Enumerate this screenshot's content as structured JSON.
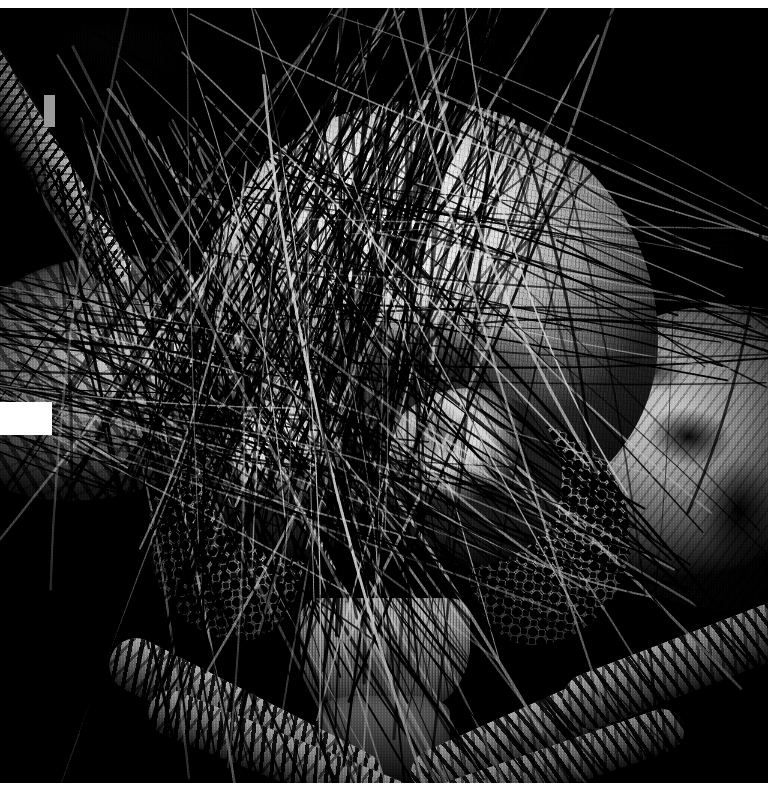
{
  "figure": {
    "kind": "scanning-electron-micrograph",
    "rendering": "monochrome black-and-white",
    "orientation": "portrait",
    "width_px": 778,
    "height_px": 804,
    "plate": {
      "left_px": 0,
      "top_px": 8,
      "width_px": 768,
      "height_px": 775
    },
    "margins": {
      "top_px": 8,
      "right_px": 10,
      "bottom_px": 21,
      "left_px": 0,
      "color": "#ffffff"
    }
  },
  "palette": {
    "background": "#000000",
    "plate_dark": "#05060a",
    "specimen_highlight": "#f2f1ee",
    "specimen_midtone": "#8e8b85",
    "specimen_shadow": "#2b2a29",
    "paper_white": "#ffffff",
    "gray_tab": "#9a9a9a"
  },
  "overlays": [
    {
      "name": "gray-tab-mark",
      "shape": "rectangle",
      "color": "#9a9a9a",
      "x": 44,
      "y": 95,
      "w": 11,
      "h": 32
    },
    {
      "name": "white-block-mask",
      "shape": "rectangle",
      "color": "#ffffff",
      "x": 0,
      "y": 402,
      "w": 52,
      "h": 33
    }
  ],
  "anatomy": {
    "vertex_dome": {
      "label": "head capsule / vertex",
      "x": 188,
      "y": 92,
      "w": 470,
      "h": 430,
      "tone": "bright"
    },
    "eye_left": {
      "label": "compound eye (left)",
      "x": 148,
      "y": 424,
      "w": 160,
      "h": 210,
      "facet_diameter_px": 18,
      "facet_pattern": "hexagonal close-packed ommatidia"
    },
    "eye_right": {
      "label": "compound eye (right)",
      "x": 462,
      "y": 418,
      "w": 168,
      "h": 220,
      "facet_diameter_px": 18,
      "facet_pattern": "hexagonal close-packed ommatidia"
    },
    "pedicel_left": {
      "label": "antennal pedicel / torus (left)",
      "x": 206,
      "y": 388,
      "w": 178,
      "h": 162,
      "tone": "bright dome"
    },
    "pedicel_right": {
      "label": "antennal pedicel / torus (right)",
      "x": 376,
      "y": 380,
      "w": 186,
      "h": 178,
      "tone": "bright dome"
    },
    "clypeus": {
      "label": "clypeus",
      "x": 300,
      "y": 590,
      "w": 170,
      "h": 118
    },
    "labium": {
      "label": "labium / proboscis base",
      "x": 318,
      "y": 688,
      "w": 132,
      "h": 96
    },
    "lobe_left": {
      "label": "lateral head lobe (left)",
      "x": -70,
      "y": 250,
      "w": 330,
      "h": 240
    },
    "lobe_right": {
      "label": "lateral head lobe (right)",
      "x": 560,
      "y": 300,
      "w": 300,
      "h": 300
    },
    "flagellum": {
      "label": "antennal flagellum (upper left)",
      "angle_deg": 58
    },
    "palps": [
      {
        "label": "scaled appendage 1",
        "x": 96,
        "y": 686,
        "w": 300,
        "h": 54,
        "angle_deg": 27
      },
      {
        "label": "scaled appendage 2",
        "x": 140,
        "y": 726,
        "w": 280,
        "h": 46,
        "angle_deg": 22
      },
      {
        "label": "scaled appendage 3",
        "x": 400,
        "y": 690,
        "w": 300,
        "h": 52,
        "angle_deg": -24
      },
      {
        "label": "scaled appendage 4",
        "x": 430,
        "y": 736,
        "w": 260,
        "h": 44,
        "angle_deg": -19
      },
      {
        "label": "scaled appendage 5",
        "x": 556,
        "y": 630,
        "w": 250,
        "h": 56,
        "angle_deg": -21
      },
      {
        "label": "scaled appendage 6",
        "x": 150,
        "y": 356,
        "w": 190,
        "h": 40,
        "angle_deg": 16
      }
    ]
  },
  "setae": {
    "description": "dense criss-crossing mesh of long dark setae (hairs) spanning the whole frame",
    "approx_count": 420,
    "color": "#0a0a0a",
    "highlight_color": "#cfcfcf",
    "min_width_px": 1,
    "max_width_px": 5
  }
}
